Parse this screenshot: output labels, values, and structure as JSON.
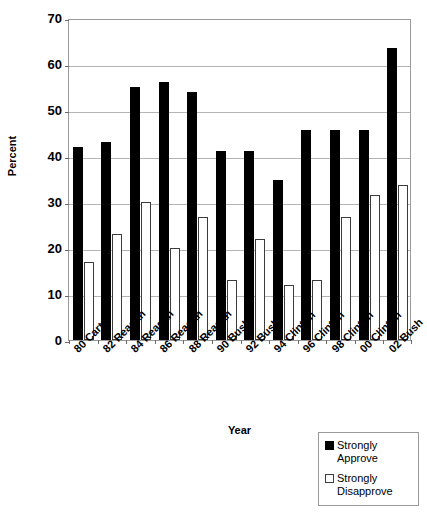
{
  "chart_data": {
    "type": "bar",
    "title": "",
    "xlabel": "Year",
    "ylabel": "Percent",
    "ylim": [
      0,
      70
    ],
    "ytick_step": 10,
    "yticks": [
      0,
      10,
      20,
      30,
      40,
      50,
      60,
      70
    ],
    "grid": true,
    "legend_position": "bottom-right",
    "categories": [
      "80 Carter",
      "82 Reagan",
      "84 Reagan",
      "86 Reagan",
      "88 Reagan",
      "90 Bush",
      "92 Bush",
      "94 Clinton",
      "96 Clinton",
      "98 Clinton",
      "00 Clinton",
      "02 Bush"
    ],
    "series": [
      {
        "name": "Strongly Approve",
        "color": "#000000",
        "values": [
          42.0,
          43.0,
          55.0,
          56.0,
          54.0,
          41.0,
          41.0,
          34.7,
          45.7,
          45.7,
          45.7,
          63.5
        ]
      },
      {
        "name": "Strongly Disapprove",
        "color": "#ffffff",
        "values": [
          17.0,
          23.0,
          30.1,
          20.0,
          26.8,
          13.1,
          22.0,
          11.9,
          13.0,
          26.7,
          31.5,
          33.7
        ]
      }
    ]
  },
  "axes": {
    "y_title": "Percent",
    "x_title": "Year",
    "y_tick_labels": [
      "70",
      "60",
      "50",
      "40",
      "30",
      "20",
      "10",
      "0"
    ]
  },
  "legend": {
    "items": [
      {
        "label": "Strongly Approve",
        "swatch": "filled-square"
      },
      {
        "label": "Strongly Disapprove",
        "swatch": "empty-square"
      }
    ]
  }
}
